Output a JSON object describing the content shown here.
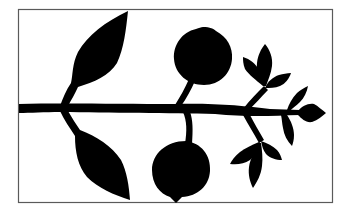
{
  "illustration": {
    "description": "Black silhouette of a fruiting branch with leaves, two round fruits and budding twigs, inside a thin rectangular frame",
    "colors": {
      "background": "#ffffff",
      "silhouette": "#000000",
      "frame": "#5a5a5a"
    },
    "elements": [
      "main-branch",
      "upper-left-leaf",
      "lower-left-leaf",
      "upper-fruit",
      "lower-fruit",
      "upper-right-twig-leaves",
      "lower-right-twig-leaves",
      "branch-tip-leaf"
    ]
  }
}
